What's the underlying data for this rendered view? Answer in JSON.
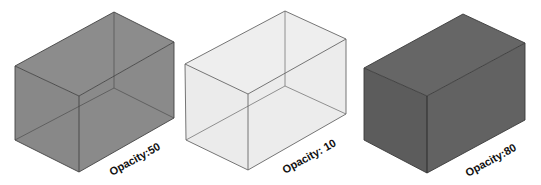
{
  "figure": {
    "background": "#ffffff",
    "edge_color": "#3a3a3a",
    "boxes": [
      {
        "label": "Opacity:50",
        "opacity": 50,
        "fill": "#8a8a8a",
        "top_fill": "#8c8c8c",
        "left_fill": "#888888",
        "right_fill": "#8a8a8a",
        "hidden_edges_visible": true
      },
      {
        "label": "Opacity: 10",
        "opacity": 10,
        "fill": "#ececec",
        "top_fill": "#eeeeee",
        "left_fill": "#ebebeb",
        "right_fill": "#ececec",
        "hidden_edges_visible": true
      },
      {
        "label": "Opacity:80",
        "opacity": 80,
        "fill": "#5f5f5f",
        "top_fill": "#666666",
        "left_fill": "#5c5c5c",
        "right_fill": "#626262",
        "hidden_edges_visible": false
      }
    ]
  }
}
